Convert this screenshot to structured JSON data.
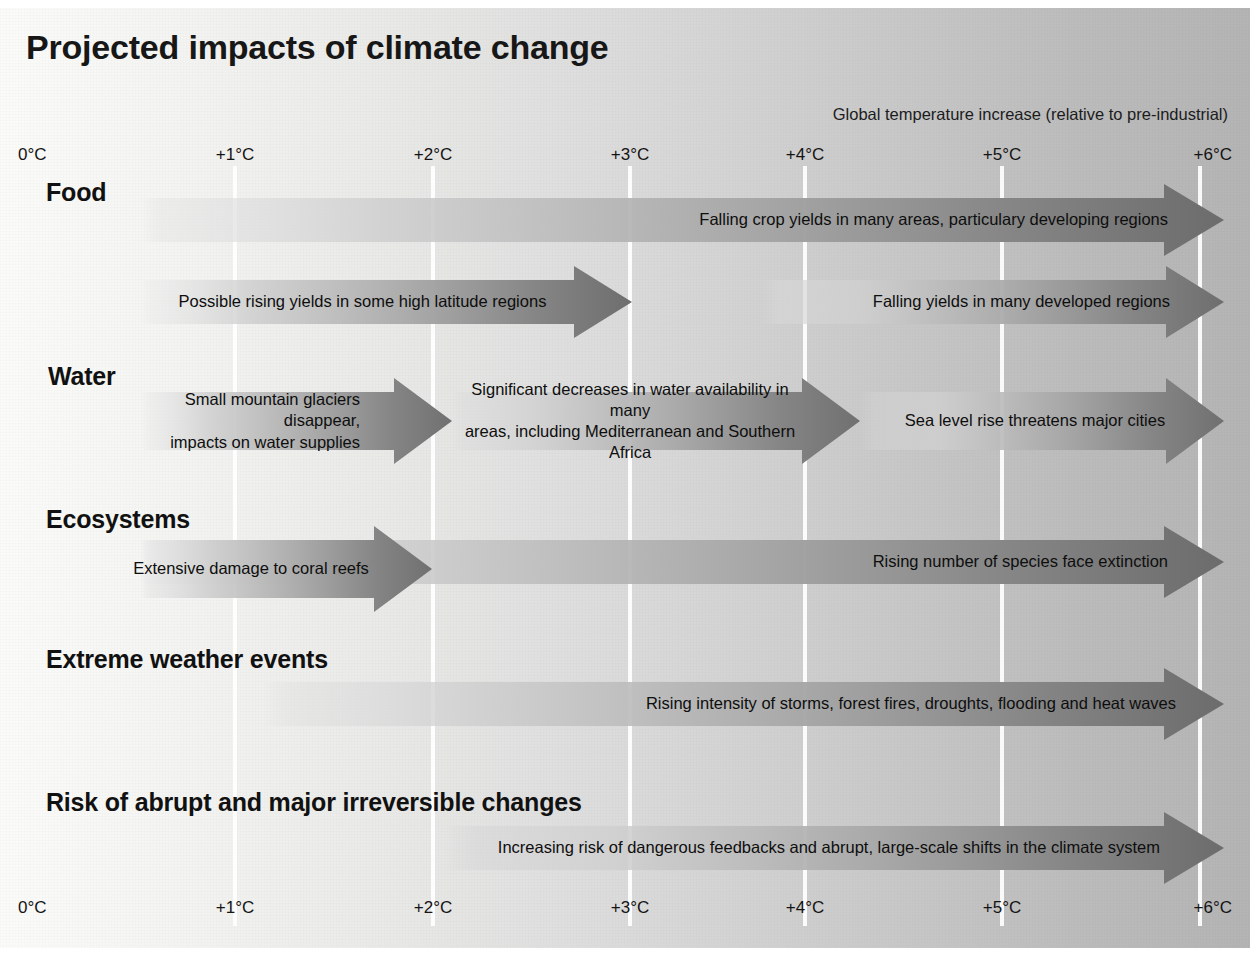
{
  "title": "Projected impacts of climate change",
  "axis": {
    "caption": "Global temperature increase (relative to pre-industrial)",
    "ticks": [
      "0°C",
      "+1°C",
      "+2°C",
      "+3°C",
      "+4°C",
      "+5°C",
      "+6°C"
    ],
    "tick_values": [
      0,
      1,
      2,
      3,
      4,
      5,
      6
    ],
    "unit": "°C"
  },
  "colors": {
    "arrow_dark": "#6e6e6e",
    "arrow_light": "#d9d9d9",
    "text": "#0e0e0e",
    "gridline": "#ffffff",
    "background_left": "#fbfbfa",
    "background_right": "#b4b4b4"
  },
  "chart_data": {
    "type": "bar",
    "title": "Projected impacts of climate change",
    "xlabel": "Global temperature increase (relative to pre-industrial)",
    "ylabel": "",
    "xlim": [
      0,
      6
    ],
    "grid": true,
    "legend": "none",
    "categories": [
      "Food",
      "Water",
      "Ecosystems",
      "Extreme weather events",
      "Risk of abrupt and major irreversible changes"
    ],
    "series": [
      {
        "name": "Food",
        "bars": [
          {
            "label": "Falling crop yields in many areas, particulary developing regions",
            "start": 0.0,
            "end": 6.1
          },
          {
            "label": "Possible rising yields in some high latitude regions",
            "start": 0.0,
            "end": 3.0
          },
          {
            "label": "Falling yields in many developed regions",
            "start": 3.6,
            "end": 6.1
          }
        ]
      },
      {
        "name": "Water",
        "bars": [
          {
            "label": "Small mountain glaciers disappear,\nimpacts on water supplies",
            "start": 0.0,
            "end": 2.1
          },
          {
            "label": "Significant decreases in water availability in many\nareas, including Mediterranean and Southern Africa",
            "start": 2.1,
            "end": 4.3
          },
          {
            "label": "Sea level rise threatens major cities",
            "start": 4.3,
            "end": 6.1
          }
        ]
      },
      {
        "name": "Ecosystems",
        "bars": [
          {
            "label": "Extensive damage to coral reefs",
            "start": 0.0,
            "end": 2.0
          },
          {
            "label": "Rising number of species face extinction",
            "start": 0.0,
            "end": 6.1
          }
        ]
      },
      {
        "name": "Extreme weather events",
        "bars": [
          {
            "label": "Rising intensity of storms, forest fires, droughts, flooding and heat waves",
            "start": 0.4,
            "end": 6.1
          }
        ]
      },
      {
        "name": "Risk of abrupt and major irreversible changes",
        "bars": [
          {
            "label": "Increasing risk of dangerous feedbacks and abrupt, large-scale shifts in the climate system",
            "start": 1.7,
            "end": 6.1
          }
        ]
      }
    ]
  },
  "rows": [
    {
      "label": "Food",
      "label_x": 46,
      "label_y": 178,
      "arrows": [
        {
          "name": "food-falling-crop-yields",
          "text": "Falling crop yields in many areas, particulary developing regions",
          "x": 140,
          "y": 184,
          "w": 1084,
          "h": 72,
          "head_w": 60,
          "head_extra": 14,
          "fade_stop": 0.02,
          "start_shade": "#e6e6e6",
          "end_shade": "#6c6c6c",
          "text_x": 600,
          "text_y": 184,
          "text_w": 568,
          "text_h": 72,
          "align": "at-right",
          "text_pad": 56
        },
        {
          "name": "food-rising-yields-high-latitude",
          "text": "Possible rising yields in some high latitude regions",
          "x": 140,
          "y": 266,
          "w": 492,
          "h": 72,
          "head_w": 58,
          "head_extra": 14,
          "fade_stop": 0.02,
          "start_shade": "#ececec",
          "end_shade": "#6e6e6e",
          "text_x": 150,
          "text_y": 266,
          "text_w": 425,
          "text_h": 72,
          "align": "at-center",
          "text_pad": 0
        },
        {
          "name": "food-falling-yields-developed",
          "text": "Falling yields in many developed regions",
          "x": 760,
          "y": 266,
          "w": 464,
          "h": 72,
          "head_w": 58,
          "head_extra": 14,
          "fade_stop": 0.04,
          "start_shade": "#d8d8d8",
          "end_shade": "#6e6e6e",
          "text_x": 790,
          "text_y": 266,
          "text_w": 380,
          "text_h": 72,
          "align": "at-right",
          "text_pad": 0
        }
      ]
    },
    {
      "label": "Water",
      "label_x": 48,
      "label_y": 362,
      "arrows": [
        {
          "name": "water-glaciers-disappear",
          "text": "Small mountain glaciers disappear,\nimpacts on water supplies",
          "x": 140,
          "y": 378,
          "w": 312,
          "h": 86,
          "head_w": 58,
          "head_extra": 14,
          "fade_stop": 0.03,
          "start_shade": "#eaeaea",
          "end_shade": "#707070",
          "text_x": 122,
          "text_y": 378,
          "text_w": 238,
          "text_h": 86,
          "align": "at-right",
          "text_pad": 0
        },
        {
          "name": "water-decreases-availability",
          "text": "Significant decreases in water availability in many\nareas, including Mediterranean and Southern Africa",
          "x": 452,
          "y": 378,
          "w": 408,
          "h": 86,
          "head_w": 58,
          "head_extra": 14,
          "fade_stop": 0.03,
          "start_shade": "#dcdcdc",
          "end_shade": "#707070",
          "text_x": 450,
          "text_y": 378,
          "text_w": 360,
          "text_h": 86,
          "align": "at-center",
          "text_pad": 0
        },
        {
          "name": "water-sea-level-rise",
          "text": "Sea level rise threatens major cities",
          "x": 860,
          "y": 378,
          "w": 364,
          "h": 86,
          "head_w": 58,
          "head_extra": 14,
          "fade_stop": 0.04,
          "start_shade": "#d2d2d2",
          "end_shade": "#707070",
          "text_x": 890,
          "text_y": 378,
          "text_w": 290,
          "text_h": 86,
          "align": "at-center",
          "text_pad": 0
        }
      ]
    },
    {
      "label": "Ecosystems",
      "label_x": 46,
      "label_y": 505,
      "arrows": [
        {
          "name": "ecosystems-species-extinction",
          "text": "Rising number of species face extinction",
          "x": 140,
          "y": 526,
          "w": 1084,
          "h": 72,
          "head_w": 60,
          "head_extra": 14,
          "fade_stop": 0.02,
          "start_shade": "#e8e8e8",
          "end_shade": "#6c6c6c",
          "text_x": 690,
          "text_y": 526,
          "text_w": 478,
          "text_h": 72,
          "align": "at-right",
          "text_pad": 0
        },
        {
          "name": "ecosystems-coral-reefs",
          "text": "Extensive damage to coral reefs",
          "x": 140,
          "y": 526,
          "w": 292,
          "h": 86,
          "head_w": 58,
          "head_extra": 14,
          "fade_stop": 0.03,
          "start_shade": "#e4e4e4",
          "end_shade": "#707070",
          "text_x": 122,
          "text_y": 526,
          "text_w": 258,
          "text_h": 86,
          "align": "at-center",
          "text_pad": 0
        }
      ]
    },
    {
      "label": "Extreme weather events",
      "label_x": 46,
      "label_y": 645,
      "arrows": [
        {
          "name": "extreme-weather-rising-intensity",
          "text": "Rising intensity of storms, forest fires, droughts, flooding and heat waves",
          "x": 262,
          "y": 668,
          "w": 962,
          "h": 72,
          "head_w": 60,
          "head_extra": 14,
          "fade_stop": 0.03,
          "start_shade": "#e2e2e2",
          "end_shade": "#6c6c6c",
          "text_x": 540,
          "text_y": 668,
          "text_w": 636,
          "text_h": 72,
          "align": "at-right",
          "text_pad": 0
        }
      ]
    },
    {
      "label": "Risk of abrupt and major irreversible changes",
      "label_x": 46,
      "label_y": 788,
      "arrows": [
        {
          "name": "risk-abrupt-feedbacks",
          "text": "Increasing risk of dangerous feedbacks and abrupt, large-scale shifts in the climate system",
          "x": 444,
          "y": 812,
          "w": 780,
          "h": 72,
          "head_w": 60,
          "head_extra": 14,
          "fade_stop": 0.04,
          "start_shade": "#d6d6d6",
          "end_shade": "#6c6c6c",
          "text_x": 390,
          "text_y": 812,
          "text_w": 770,
          "text_h": 72,
          "align": "at-right",
          "text_pad": 0
        }
      ]
    }
  ],
  "gridlines_x": [
    235,
    433,
    630,
    805,
    1002,
    1200
  ],
  "tick_positions_top": [
    {
      "x": 18,
      "cls": "first"
    },
    {
      "x": 235,
      "cls": ""
    },
    {
      "x": 433,
      "cls": ""
    },
    {
      "x": 630,
      "cls": ""
    },
    {
      "x": 805,
      "cls": ""
    },
    {
      "x": 1002,
      "cls": ""
    },
    {
      "x": 1232,
      "cls": "last"
    }
  ],
  "tick_y_top": 145,
  "tick_y_bottom": 898
}
